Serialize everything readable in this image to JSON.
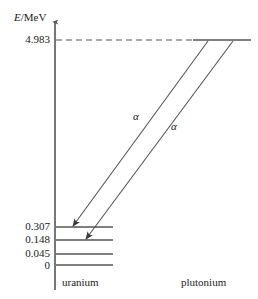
{
  "axis": {
    "title_symbol": "E",
    "title_unit": "/MeV"
  },
  "levels": {
    "parent": {
      "label": "4.983",
      "value": 4.983
    },
    "daughter": [
      {
        "label": "0.307",
        "value": 0.307
      },
      {
        "label": "0.148",
        "value": 0.148
      },
      {
        "label": "0.045",
        "value": 0.045
      },
      {
        "label": "0",
        "value": 0.0
      }
    ]
  },
  "transitions": [
    {
      "label": "α",
      "from": 4.983,
      "to": 0.307
    },
    {
      "label": "α",
      "from": 4.983,
      "to": 0.148
    }
  ],
  "nuclides": {
    "left": "uranium",
    "right": "plutonium"
  },
  "colors": {
    "line": "#555555",
    "text": "#1a1a1a",
    "background": "#ffffff"
  }
}
